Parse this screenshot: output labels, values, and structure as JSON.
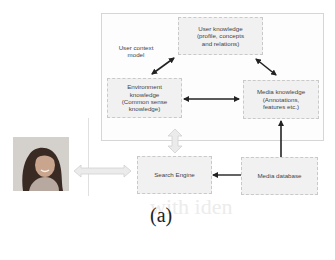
{
  "diagram": {
    "outer_box_label": [
      "User context",
      "model"
    ],
    "nodes": {
      "user_knowledge": [
        "User knowledge",
        "(profile, concepts",
        "and relations)"
      ],
      "environment_knowledge": [
        "Environment",
        "knowledge",
        "(Common sense",
        "knowledge)"
      ],
      "media_knowledge": [
        "Media knowledge",
        "(Annotations,",
        "features etc.)"
      ],
      "search_engine": "Search Engine",
      "media_database": "Media database"
    },
    "edges": [
      {
        "from": "environment_knowledge",
        "to": "user_knowledge",
        "type": "bidirectional"
      },
      {
        "from": "user_knowledge",
        "to": "media_knowledge",
        "type": "bidirectional"
      },
      {
        "from": "environment_knowledge",
        "to": "media_knowledge",
        "type": "bidirectional"
      },
      {
        "from": "user_context_model",
        "to": "search_engine",
        "type": "bidirectional-hollow"
      },
      {
        "from": "user",
        "to": "search_engine",
        "type": "bidirectional-hollow"
      },
      {
        "from": "media_database",
        "to": "search_engine",
        "type": "directed"
      },
      {
        "from": "media_database",
        "to": "media_knowledge",
        "type": "directed"
      }
    ],
    "user_photo": "user-photo",
    "caption": "(a)"
  },
  "colors": {
    "box_fill": "#f1f1f1",
    "box_border": "#c9c9c9",
    "arrow": "#222222",
    "hollow_arrow": "#d9d9d9"
  }
}
